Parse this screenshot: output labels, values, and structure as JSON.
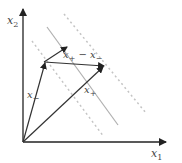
{
  "diagram": {
    "type": "svm-margin-vector-diagram",
    "axes": {
      "x_label": "x",
      "x_label_sub": "1",
      "y_label": "x",
      "y_label_sub": "2"
    },
    "vectors": {
      "x_minus": {
        "label": "x",
        "label_sub": "−"
      },
      "x_plus": {
        "label": "x",
        "label_sub": "+"
      },
      "difference": {
        "label_a": "x",
        "label_a_sub": "+",
        "op": " − ",
        "label_b": "x",
        "label_b_sub": "−"
      }
    },
    "lines": {
      "decision_boundary": "solid",
      "margin_upper": "dashed",
      "margin_lower": "dashed"
    },
    "colors": {
      "axis": "#222222",
      "vector": "#333333",
      "boundary": "#aaaaaa",
      "margin": "#c0c0c0",
      "text": "#444444"
    }
  }
}
